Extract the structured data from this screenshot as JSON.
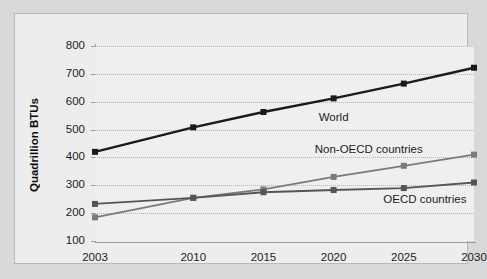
{
  "chart_data": {
    "type": "line",
    "title": "",
    "subtitle": "",
    "xlabel": "",
    "ylabel": "Quadrillion BTUs",
    "categories": [
      "2003",
      "2010",
      "2015",
      "2020",
      "2025",
      "2030"
    ],
    "x": [
      2003,
      2010,
      2015,
      2020,
      2025,
      2030
    ],
    "xlim": [
      2003,
      2030
    ],
    "ylim": [
      100,
      800
    ],
    "yticks": [
      100,
      200,
      300,
      400,
      500,
      600,
      700,
      800
    ],
    "ytick_labels": [
      "100",
      "200",
      "300",
      "400",
      "500",
      "600",
      "700",
      "800"
    ],
    "xtick_labels": [
      "2003",
      "2010",
      "2015",
      "2020",
      "2025",
      "2030"
    ],
    "grid": "horizontal-dotted",
    "legend": "inline-annotations",
    "marker": "square",
    "series": [
      {
        "name": "World",
        "color": "#1a1a1a",
        "values": [
          420,
          508,
          563,
          612,
          665,
          722
        ],
        "annotation": "World"
      },
      {
        "name": "Non-OECD countries",
        "color": "#7b7b7b",
        "values": [
          185,
          255,
          285,
          330,
          370,
          410
        ],
        "annotation": "Non-OECD countries"
      },
      {
        "name": "OECD countries",
        "color": "#555555",
        "values": [
          233,
          255,
          275,
          283,
          290,
          310
        ],
        "annotation": "OECD countries"
      }
    ],
    "annotations": [
      {
        "text": "World",
        "x": 2020,
        "y": 545
      },
      {
        "text": "Non-OECD countries",
        "x": 2022.5,
        "y": 432
      },
      {
        "text": "OECD countries",
        "x": 2026.5,
        "y": 250
      }
    ],
    "colors": {
      "figure_background": "#d9d9d9",
      "panel_background": "#efefef",
      "gridline": "#aeb4bb",
      "axis": "#9a9a9a",
      "text": "#1c1c1c"
    }
  }
}
